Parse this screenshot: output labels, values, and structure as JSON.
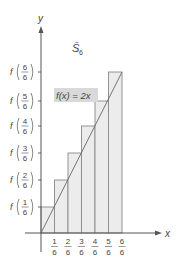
{
  "diagram": {
    "title": "S̄",
    "title_subscript": "6",
    "function_label": "f(x) = 2x",
    "x_axis_label": "x",
    "y_axis_label": "y",
    "x_ticks": [
      {
        "num": "1",
        "den": "6"
      },
      {
        "num": "2",
        "den": "6"
      },
      {
        "num": "3",
        "den": "6"
      },
      {
        "num": "4",
        "den": "6"
      },
      {
        "num": "5",
        "den": "6"
      },
      {
        "num": "6",
        "den": "6"
      }
    ],
    "y_ticks": [
      {
        "prefix": "f",
        "num": "1",
        "den": "6"
      },
      {
        "prefix": "f",
        "num": "2",
        "den": "6"
      },
      {
        "prefix": "f",
        "num": "3",
        "den": "6"
      },
      {
        "prefix": "f",
        "num": "4",
        "den": "6"
      },
      {
        "prefix": "f",
        "num": "5",
        "den": "6"
      },
      {
        "prefix": "f",
        "num": "6",
        "den": "6"
      }
    ],
    "colors": {
      "bar_fill": "#ececec",
      "bar_stroke": "#8a8a8a",
      "axis": "#555555",
      "label_box": "#d9d9d9",
      "text": "#444444"
    }
  }
}
